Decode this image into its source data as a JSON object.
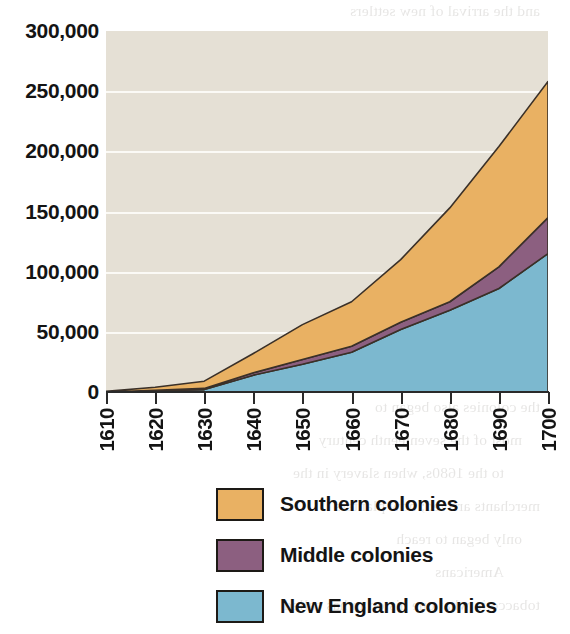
{
  "chart_data": {
    "type": "area",
    "stacked": true,
    "title": "",
    "subtitle": "",
    "xlabel": "",
    "ylabel": "",
    "x": [
      1610,
      1620,
      1630,
      1640,
      1650,
      1660,
      1670,
      1680,
      1690,
      1700
    ],
    "xtick_labels": [
      "1610",
      "1620",
      "1630",
      "1640",
      "1650",
      "1660",
      "1670",
      "1680",
      "1690",
      "1700"
    ],
    "ytick_labels": [
      "300,000",
      "250,000",
      "200,000",
      "150,000",
      "100,000",
      "50,000",
      "0"
    ],
    "ytick_values": [
      300000,
      250000,
      200000,
      150000,
      100000,
      50000,
      0
    ],
    "ylim": [
      0,
      300000
    ],
    "xlim": [
      1610,
      1700
    ],
    "grid": true,
    "grid_axis": "y",
    "legend_position": "bottom",
    "series": [
      {
        "name": "New England colonies",
        "color": "#7cb8cf",
        "values": [
          0,
          1000,
          2000,
          14000,
          23000,
          33000,
          52000,
          68000,
          86000,
          115000
        ]
      },
      {
        "name": "Middle colonies",
        "color": "#8c5f80",
        "values": [
          0,
          500,
          1000,
          2000,
          4000,
          5000,
          6000,
          7000,
          18000,
          30000
        ]
      },
      {
        "name": "Southern colonies",
        "color": "#e9b163",
        "values": [
          500,
          2500,
          6000,
          16000,
          29000,
          37000,
          52000,
          78000,
          100000,
          113000
        ]
      }
    ],
    "cumulative_totals": [
      500,
      4000,
      9000,
      32000,
      56000,
      75000,
      110000,
      153000,
      204000,
      258000
    ],
    "plot_background": "#e5e0d5",
    "gridline_color": "#fbfaf6",
    "axis_color": "#2a2a2a",
    "outline_color": "#3a3028"
  },
  "legend": {
    "items": [
      {
        "label": "Southern colonies",
        "color": "#e9b163"
      },
      {
        "label": "Middle colonies",
        "color": "#8c5f80"
      },
      {
        "label": "New England colonies",
        "color": "#7cb8cf"
      }
    ]
  },
  "bleed_text": {
    "fragment_top": "",
    "lines": [
      "and the arrival of new settlers",
      "the Indians, who in turn",
      "the power of the",
      "as well as colony and colonial",
      "and the colonies in the",
      "to the seventeenth century, the New",
      "colonists had established their",
      "in the 1600s, migrants",
      "with the",
      "as the material and population",
      "and the Chesapeake needed",
      "for labor",
      "the colonies also began to",
      "most of the seventeenth century",
      "to the 1680s, when slavery in the",
      "merchants arrived; now planters",
      "only began to reach",
      "Americans",
      "tobacco in what one historian has called"
    ]
  }
}
